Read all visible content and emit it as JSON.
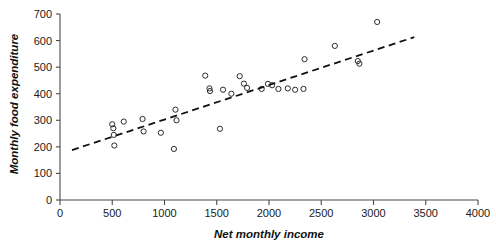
{
  "chart_data": {
    "type": "scatter",
    "title": "",
    "xlabel": "Net monthly income",
    "ylabel": "Monthly food expenditure",
    "xlim": [
      0,
      4000
    ],
    "ylim": [
      0,
      700
    ],
    "xticks": [
      0,
      500,
      1000,
      1500,
      2000,
      2500,
      3000,
      3500,
      4000
    ],
    "yticks": [
      0,
      100,
      200,
      300,
      400,
      500,
      600,
      700
    ],
    "xtick_labels": [
      "0",
      "500",
      "1000",
      "1500",
      "2000",
      "2500",
      "3000",
      "3500",
      "4000"
    ],
    "ytick_labels": [
      "0",
      "100",
      "200",
      "300",
      "400",
      "500",
      "600",
      "700"
    ],
    "grid": false,
    "legend": false,
    "marker": "open-circle",
    "marker_color": "#2b2b2b",
    "points": [
      {
        "x": 500,
        "y": 285
      },
      {
        "x": 510,
        "y": 270
      },
      {
        "x": 515,
        "y": 245
      },
      {
        "x": 520,
        "y": 205
      },
      {
        "x": 610,
        "y": 295
      },
      {
        "x": 790,
        "y": 305
      },
      {
        "x": 800,
        "y": 258
      },
      {
        "x": 965,
        "y": 253
      },
      {
        "x": 1090,
        "y": 192
      },
      {
        "x": 1105,
        "y": 340
      },
      {
        "x": 1115,
        "y": 300
      },
      {
        "x": 1530,
        "y": 268
      },
      {
        "x": 1390,
        "y": 468
      },
      {
        "x": 1430,
        "y": 420
      },
      {
        "x": 1435,
        "y": 410
      },
      {
        "x": 1560,
        "y": 415
      },
      {
        "x": 1640,
        "y": 400
      },
      {
        "x": 1720,
        "y": 466
      },
      {
        "x": 1760,
        "y": 438
      },
      {
        "x": 1790,
        "y": 422
      },
      {
        "x": 1930,
        "y": 418
      },
      {
        "x": 1990,
        "y": 437
      },
      {
        "x": 2030,
        "y": 432
      },
      {
        "x": 2090,
        "y": 418
      },
      {
        "x": 2180,
        "y": 420
      },
      {
        "x": 2250,
        "y": 415
      },
      {
        "x": 2330,
        "y": 418
      },
      {
        "x": 2340,
        "y": 530
      },
      {
        "x": 2630,
        "y": 580
      },
      {
        "x": 2850,
        "y": 523
      },
      {
        "x": 2865,
        "y": 513
      },
      {
        "x": 3035,
        "y": 670
      }
    ],
    "trend_line": {
      "style": "dashed",
      "color": "#111111",
      "x_start": 115,
      "y_start": 188,
      "x_end": 3390,
      "y_end": 613
    }
  }
}
